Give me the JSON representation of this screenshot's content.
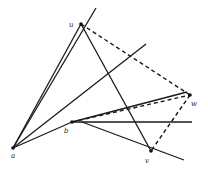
{
  "diagram": {
    "points": [
      {
        "id": "u",
        "label": "u",
        "x": 81,
        "y": 24,
        "lx": 69,
        "ly": 27
      },
      {
        "id": "w",
        "label": "w",
        "x": 190,
        "y": 95,
        "lx": 191,
        "ly": 106
      },
      {
        "id": "b",
        "label": "b",
        "x": 72,
        "y": 122,
        "lx": 64,
        "ly": 133
      },
      {
        "id": "a",
        "label": "a",
        "x": 13,
        "y": 148,
        "lx": 11,
        "ly": 158
      },
      {
        "id": "v",
        "label": "v",
        "x": 151,
        "y": 151,
        "lx": 145,
        "ly": 163
      }
    ],
    "solid_lines": [
      {
        "x1": 13,
        "y1": 148,
        "x2": 81,
        "y2": 24
      },
      {
        "x1": 13,
        "y1": 148,
        "x2": 96,
        "y2": 8
      },
      {
        "x1": 13,
        "y1": 148,
        "x2": 146,
        "y2": 44
      },
      {
        "x1": 13,
        "y1": 148,
        "x2": 72,
        "y2": 122
      },
      {
        "x1": 81,
        "y1": 24,
        "x2": 151,
        "y2": 151
      },
      {
        "x1": 72,
        "y1": 122,
        "x2": 187,
        "y2": 92
      },
      {
        "x1": 72,
        "y1": 122,
        "x2": 192,
        "y2": 122
      },
      {
        "x1": 82,
        "y1": 122,
        "x2": 184,
        "y2": 160
      }
    ],
    "dashed_lines": [
      {
        "x1": 81,
        "y1": 24,
        "x2": 190,
        "y2": 95
      },
      {
        "x1": 72,
        "y1": 122,
        "x2": 190,
        "y2": 95
      },
      {
        "x1": 190,
        "y1": 95,
        "x2": 151,
        "y2": 151
      }
    ]
  }
}
